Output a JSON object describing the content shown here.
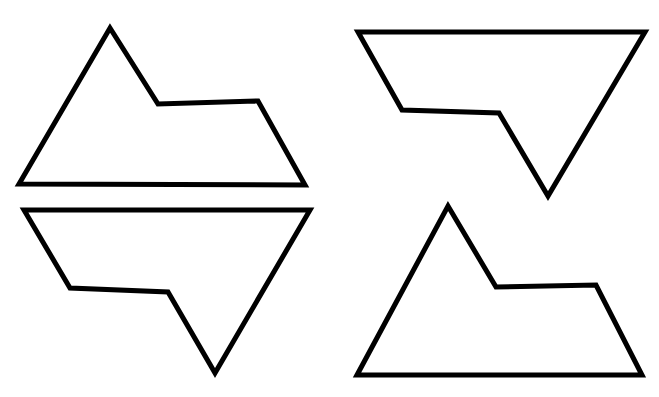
{
  "page": {
    "background_color": "#ffffff",
    "width": 659,
    "height": 397
  },
  "figure": {
    "type": "line-drawing",
    "shape_count": 4,
    "stroke_color": "#000000",
    "fill_color": "none",
    "stroke_width": 5,
    "shape_name": "mountain-plateau-heptagon",
    "vertex_count": 5
  },
  "shapes": [
    {
      "id": "shape-top-left",
      "name": "shape-top-left",
      "position": "top-left",
      "orientation": "upright",
      "rotation_degrees": 0,
      "points": "19,184 110,28 158,104 258,101 305,185",
      "bbox": {
        "x": 19,
        "y": 28,
        "width": 286,
        "height": 157
      },
      "vertices": [
        {
          "label": "bottom-left-corner",
          "x": 19,
          "y": 184
        },
        {
          "label": "peak-apex",
          "x": 110,
          "y": 28
        },
        {
          "label": "notch-inner-corner",
          "x": 158,
          "y": 104
        },
        {
          "label": "plateau-right-corner",
          "x": 258,
          "y": 101
        },
        {
          "label": "bottom-right-corner",
          "x": 305,
          "y": 185
        }
      ]
    },
    {
      "id": "shape-bottom-left",
      "name": "shape-bottom-left",
      "position": "bottom-left",
      "orientation": "rotated",
      "rotation_degrees": 180,
      "points": "24,210 310,210 215,373 168,292 70,288",
      "bbox": {
        "x": 24,
        "y": 210,
        "width": 286,
        "height": 163
      },
      "vertices": [
        {
          "label": "top-left-corner",
          "x": 24,
          "y": 210
        },
        {
          "label": "top-right-corner",
          "x": 310,
          "y": 210
        },
        {
          "label": "valley-apex",
          "x": 215,
          "y": 373
        },
        {
          "label": "notch-inner-corner",
          "x": 168,
          "y": 292
        },
        {
          "label": "plateau-left-corner",
          "x": 70,
          "y": 288
        }
      ]
    },
    {
      "id": "shape-top-right",
      "name": "shape-top-right",
      "position": "top-right",
      "orientation": "rotated",
      "rotation_degrees": 180,
      "points": "358,32 645,32 548,196 499,113 402,110",
      "bbox": {
        "x": 358,
        "y": 32,
        "width": 287,
        "height": 164
      },
      "vertices": [
        {
          "label": "top-left-corner",
          "x": 358,
          "y": 32
        },
        {
          "label": "top-right-corner",
          "x": 645,
          "y": 32
        },
        {
          "label": "valley-apex",
          "x": 548,
          "y": 196
        },
        {
          "label": "notch-inner-corner",
          "x": 499,
          "y": 113
        },
        {
          "label": "plateau-left-corner",
          "x": 402,
          "y": 110
        }
      ]
    },
    {
      "id": "shape-bottom-right",
      "name": "shape-bottom-right",
      "position": "bottom-right",
      "orientation": "upright",
      "rotation_degrees": 0,
      "points": "357,375 448,206 496,287 596,285 642,375",
      "bbox": {
        "x": 357,
        "y": 206,
        "width": 285,
        "height": 169
      },
      "vertices": [
        {
          "label": "bottom-left-corner",
          "x": 357,
          "y": 375
        },
        {
          "label": "peak-apex",
          "x": 448,
          "y": 206
        },
        {
          "label": "notch-inner-corner",
          "x": 496,
          "y": 287
        },
        {
          "label": "plateau-right-corner",
          "x": 596,
          "y": 285
        },
        {
          "label": "bottom-right-corner",
          "x": 642,
          "y": 375
        }
      ]
    }
  ]
}
